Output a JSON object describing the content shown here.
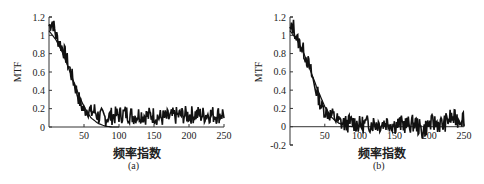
{
  "chart_data": [
    {
      "type": "line",
      "panel": "(a)",
      "title": "",
      "xlabel": "频率指数",
      "ylabel": "MTF",
      "caption": "(a)",
      "xlim": [
        0,
        250
      ],
      "ylim": [
        0,
        1.2
      ],
      "xticks": [
        50,
        100,
        150,
        200,
        250
      ],
      "yticks": [
        0,
        0.2,
        0.4,
        0.6,
        0.8,
        1,
        1.2
      ],
      "xtick_labels": [
        "50",
        "100",
        "150",
        "200",
        "250"
      ],
      "ytick_labels": [
        "0",
        "0.2",
        "0.4",
        "0.6",
        "0.8",
        "1",
        "1.2"
      ],
      "grid": false,
      "legend": null,
      "series": [
        {
          "name": "measured MTF (noisy)",
          "x": [
            0,
            5,
            10,
            15,
            20,
            25,
            30,
            35,
            40,
            45,
            50,
            55,
            60,
            65,
            70,
            80,
            90,
            100,
            110,
            120,
            130,
            140,
            150,
            160,
            170,
            180,
            190,
            200,
            210,
            220,
            230,
            240,
            250
          ],
          "y": [
            1.1,
            1.15,
            1.0,
            0.92,
            0.85,
            0.75,
            0.62,
            0.5,
            0.38,
            0.25,
            0.18,
            0.2,
            0.15,
            0.18,
            0.12,
            0.1,
            0.12,
            0.13,
            0.15,
            0.12,
            0.14,
            0.12,
            0.13,
            0.1,
            0.1,
            0.12,
            0.13,
            0.13,
            0.14,
            0.13,
            0.14,
            0.13,
            0.15
          ]
        },
        {
          "name": "fitted MTF",
          "x": [
            0,
            10,
            20,
            30,
            40,
            50,
            60,
            70,
            80,
            90,
            100
          ],
          "y": [
            1.05,
            0.95,
            0.8,
            0.6,
            0.4,
            0.22,
            0.1,
            0.04,
            0.01,
            0.0,
            0.0
          ]
        }
      ]
    },
    {
      "type": "line",
      "panel": "(b)",
      "title": "",
      "xlabel": "频率指数",
      "ylabel": "MTF",
      "caption": "(b)",
      "xlim": [
        0,
        250
      ],
      "ylim": [
        -0.2,
        1.2
      ],
      "xticks": [
        50,
        100,
        150,
        200,
        250
      ],
      "yticks": [
        -0.2,
        0,
        0.2,
        0.4,
        0.6,
        0.8,
        1,
        1.2
      ],
      "xtick_labels": [
        "50",
        "100",
        "150",
        "200",
        "250"
      ],
      "ytick_labels": [
        "-0.2",
        "0",
        "0.2",
        "0.4",
        "0.6",
        "0.8",
        "1",
        "1.2"
      ],
      "grid": false,
      "legend": null,
      "series": [
        {
          "name": "measured MTF (noisy)",
          "x": [
            0,
            5,
            10,
            15,
            20,
            25,
            30,
            35,
            40,
            45,
            50,
            55,
            60,
            65,
            70,
            80,
            90,
            100,
            110,
            120,
            130,
            140,
            150,
            160,
            170,
            180,
            190,
            200,
            210,
            220,
            230,
            240,
            250
          ],
          "y": [
            1.05,
            1.1,
            0.95,
            0.9,
            0.82,
            0.72,
            0.6,
            0.45,
            0.35,
            0.22,
            0.18,
            0.15,
            0.12,
            0.1,
            0.05,
            0.03,
            0.05,
            0.02,
            0.03,
            0.04,
            0.03,
            0.05,
            0.02,
            0.03,
            0.02,
            0.04,
            -0.05,
            0.03,
            0.04,
            0.02,
            0.1,
            0.08,
            0.1
          ]
        },
        {
          "name": "fitted MTF",
          "x": [
            0,
            10,
            20,
            30,
            40,
            50,
            60,
            70,
            80,
            90,
            100
          ],
          "y": [
            1.05,
            0.95,
            0.8,
            0.6,
            0.4,
            0.22,
            0.1,
            0.04,
            0.01,
            0.0,
            0.0
          ]
        }
      ]
    }
  ],
  "panels": [
    {
      "caption": "(a)",
      "xlabel": "频率指数",
      "ylabel": "MTF"
    },
    {
      "caption": "(b)",
      "xlabel": "频率指数",
      "ylabel": "MTF"
    }
  ],
  "colors": {
    "line": "#111111",
    "axis": "#333333",
    "background": "#ffffff"
  }
}
